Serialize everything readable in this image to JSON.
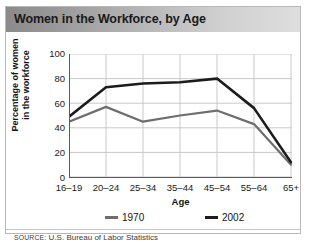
{
  "title": "Women in the Workforce, by Age",
  "source": {
    "prefix": "SOURCE:",
    "text": " U.S. Bureau of Labor Statistics"
  },
  "colors": {
    "series_1970": "#6e6e6e",
    "series_2002": "#1c1c1c",
    "grid": "#c9c9c9",
    "axis": "#5a5a5a",
    "title_bar_dark": "#8a8a8a",
    "title_bar_light": "#dedede",
    "frame": "#b8b8b8"
  },
  "chart_data": {
    "type": "line",
    "title": "Women in the Workforce, by Age",
    "xlabel": "Age",
    "ylabel": "Percentage of women in the workforce",
    "ylabel_line1": "Percentage of women",
    "ylabel_line2": "in the workforce",
    "categories": [
      "16–19",
      "20–24",
      "25–34",
      "35–44",
      "45–54",
      "55–64",
      "65+"
    ],
    "ylim": [
      0,
      100
    ],
    "yticks": [
      0,
      20,
      40,
      60,
      80,
      100
    ],
    "ytick_labels": [
      "0",
      "20",
      "40",
      "60",
      "80",
      "100"
    ],
    "grid": true,
    "legend_position": "bottom",
    "series": [
      {
        "name": "1970",
        "color": "#6e6e6e",
        "values": [
          45,
          57,
          45,
          50,
          54,
          43,
          10
        ]
      },
      {
        "name": "2002",
        "color": "#1c1c1c",
        "values": [
          49,
          73,
          76,
          77,
          80,
          56,
          12
        ]
      }
    ]
  }
}
